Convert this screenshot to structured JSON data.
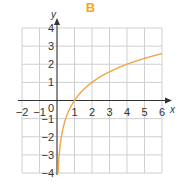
{
  "chart_data": {
    "type": "line",
    "title": "B",
    "xlabel": "x",
    "ylabel": "y",
    "xlim": [
      -2,
      6
    ],
    "ylim": [
      -4,
      4
    ],
    "xticks": [
      "-2",
      "-1",
      "0",
      "1",
      "2",
      "3",
      "4",
      "5",
      "6"
    ],
    "yticks": [
      "-4",
      "-3",
      "-2",
      "-1",
      "1",
      "2",
      "3",
      "4"
    ],
    "origin_label": "0",
    "grid": true,
    "legend": null,
    "series": [
      {
        "name": "y = log2(x)",
        "x": [
          0.0625,
          0.125,
          0.25,
          0.5,
          1,
          2,
          3,
          4,
          5,
          6
        ],
        "y": [
          -4,
          -3,
          -2,
          -1,
          0,
          1,
          1.58,
          2,
          2.32,
          2.58
        ]
      }
    ]
  },
  "colors": {
    "title": "#f5a623",
    "curve": "#f0a448",
    "grid": "#cfcfcf",
    "axis": "#333333"
  }
}
